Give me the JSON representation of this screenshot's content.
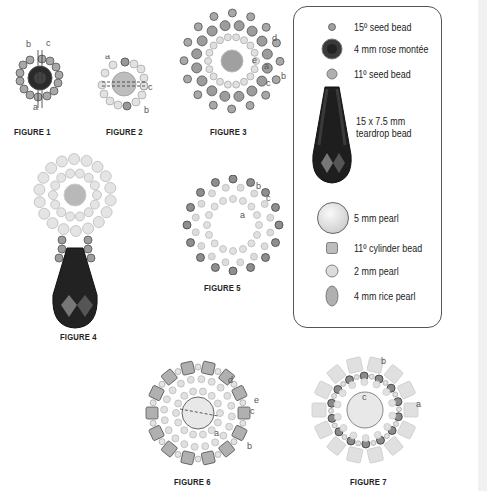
{
  "figures": [
    {
      "id": "figure-1",
      "caption": "FIGURE 1",
      "labels": [
        "a",
        "b",
        "c"
      ]
    },
    {
      "id": "figure-2",
      "caption": "FIGURE 2",
      "labels": [
        "a",
        "b",
        "c"
      ]
    },
    {
      "id": "figure-3",
      "caption": "FIGURE 3",
      "labels": [
        "a",
        "b",
        "c",
        "d",
        "e"
      ]
    },
    {
      "id": "figure-4",
      "caption": "FIGURE 4",
      "labels": []
    },
    {
      "id": "figure-5",
      "caption": "FIGURE 5",
      "labels": [
        "a",
        "b",
        "c"
      ]
    },
    {
      "id": "figure-6",
      "caption": "FIGURE 6",
      "labels": [
        "a",
        "b",
        "c",
        "d",
        "e"
      ]
    },
    {
      "id": "figure-7",
      "caption": "FIGURE 7",
      "labels": [
        "a",
        "b",
        "c"
      ]
    }
  ],
  "legend": {
    "items": [
      {
        "icon": "seed-bead-15-icon",
        "label": "15º seed bead"
      },
      {
        "icon": "rose-montee-icon",
        "label": "4 mm rose montée"
      },
      {
        "icon": "seed-bead-11-icon",
        "label": "11º seed bead"
      },
      {
        "icon": "teardrop-bead-icon",
        "label_line1": "15 x 7.5 mm",
        "label_line2": "teardrop bead"
      },
      {
        "icon": "pearl-5mm-icon",
        "label": "5 mm pearl"
      },
      {
        "icon": "cylinder-bead-icon",
        "label": "11º cylinder bead"
      },
      {
        "icon": "pearl-2mm-icon",
        "label": "2 mm pearl"
      },
      {
        "icon": "rice-pearl-icon",
        "label": "4 mm rice pearl"
      }
    ]
  },
  "colors": {
    "seed15": "#9a9a9a",
    "seed11": "#b5b5b5",
    "dark_crystal": "#2a2a2a",
    "pearl": "#e4e4e4",
    "outline": "#555555"
  }
}
